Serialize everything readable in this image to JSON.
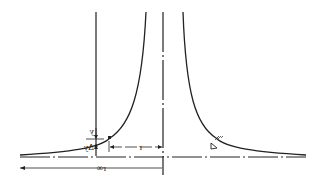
{
  "diagram": {
    "labels": {
      "y": "y",
      "delta_y": "Δy",
      "r": "r",
      "r_inf": "r∞",
      "water_surface_symbol": "▽"
    },
    "colors": {
      "line": "#222222",
      "background": "#ffffff"
    }
  }
}
